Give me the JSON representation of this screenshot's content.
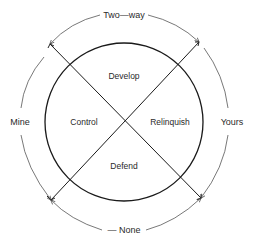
{
  "diagram": {
    "quadrants": {
      "top": "Develop",
      "left": "Control",
      "right": "Relinquish",
      "bottom": "Defend"
    },
    "outer_labels": {
      "top": "Two—way",
      "left": "Mine",
      "right": "Yours",
      "bottom": "— None"
    },
    "colors": {
      "line": "#1a1a1a",
      "arc": "#555555",
      "text": "#2a2a2a",
      "background": "#ffffff"
    }
  }
}
